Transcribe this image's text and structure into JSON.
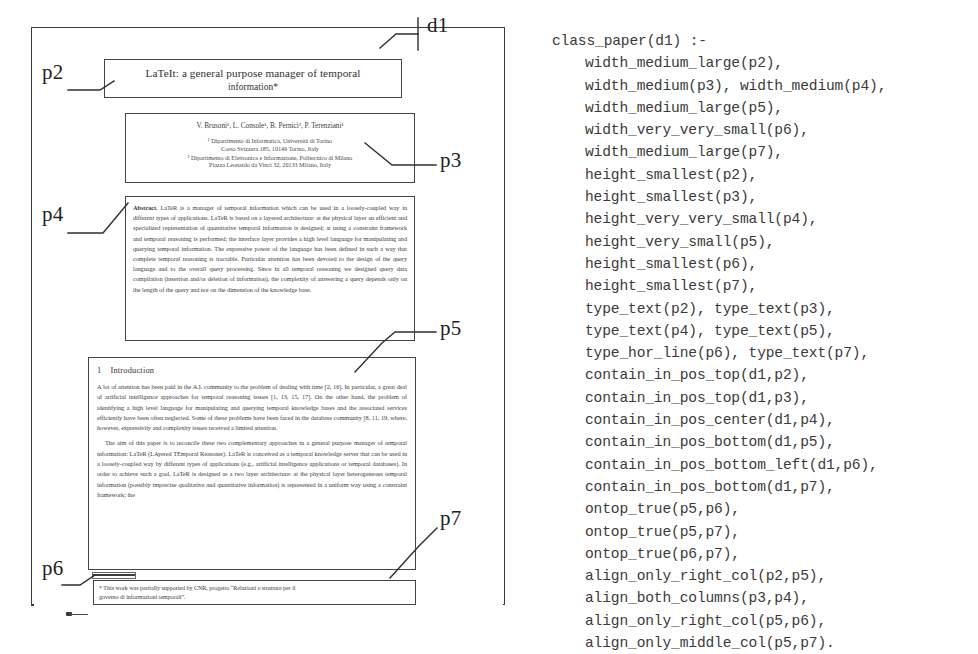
{
  "document_figure": {
    "frame_label": "d1",
    "part_labels": [
      "d1",
      "p2",
      "p3",
      "p4",
      "p5",
      "p6",
      "p7"
    ],
    "labels": {
      "d1": "d1",
      "p2": "p2",
      "p3": "p3",
      "p4": "p4",
      "p5": "p5",
      "p6": "p6",
      "p7": "p7"
    },
    "p2_title_block": {
      "line1": "LaTeIt: a general purpose manager of temporal",
      "line2": "information*"
    },
    "p3_author_block": {
      "authors": "V. Brusoni¹, L. Console¹, B. Pernici², P. Terenziani¹",
      "aff1_line1": "¹ Dipartimento di Informatica, Università di Torino",
      "aff1_line2": "Corso Svizzera 185, 10149 Torino, Italy",
      "aff2_line1": "² Dipartimento di Elettronica e Informazione, Politecnico di Milano",
      "aff2_line2": "Piazza Leonardo da Vinci 32, 20133 Milano, Italy"
    },
    "p4_abstract_block": {
      "heading": "Abstract.",
      "text": "LaTeR is a manager of temporal information which can be used in a loosely-coupled way in different types of applications. LaTeR is based on a layered architecture: at the physical layer an efficient and specialized representation of quantitative temporal information is designed; at using a constraint framework and temporal reasoning is performed; the interface layer provides a high level language for manipulating and querying temporal information. The expressive power of the language has been defined in such a way that complete temporal reasoning is tractable. Particular attention has been devoted to the design of the query language and to the overall query processing. Since in all temporal reasoning we designed query data compilation (insertion and/or deletion of information), the complexity of answering a query depends only on the length of the query and not on the dimension of the knowledge base."
    },
    "p5_body_block": {
      "section_number": "1",
      "section_title": "Introduction",
      "paragraph1": "A lot of attention has been paid in the A.I. community to the problem of dealing with time [2, 16]. In particular, a great deal of artificial intelligence approaches for temporal reasoning issues [1, 13, 15, 17]. On the other hand, the problem of identifying a high level language for manipulating and querying temporal knowledge bases and the associated services efficiently have been often neglected. Some of these problems have been faced in the database community [8, 11, 19, where, however, expressivity and complexity issues received a limited attention.",
      "paragraph2": "The aim of this paper is to reconcile these two complementary approaches in a general purpose manager of temporal information: LaTeR (LAyered TEmporal Reasoner). LaTeR is conceived as a temporal knowledge server that can be used in a loosely-coupled way by different types of applications (e.g., artificial intelligence applications or temporal databases). In order to achieve such a goal, LaTeR is designed as a two layer architecture: at the physical layer heterogeneous temporal information (possibly imprecise qualitative and quantitative information) is represented in a uniform way using a constraint framework; the"
    },
    "p6_rule_block": {
      "type": "horizontal line"
    },
    "p7_footnote_block": {
      "line1": "* This work was partially supported by CNR, progetto “Relazioni e strutture per il",
      "line2": "governo di informazioni temporali”."
    }
  },
  "code_listing": {
    "language": "prolog",
    "head": "class_paper(d1) :-",
    "lines": [
      "width_medium_large(p2),",
      "width_medium(p3), width_medium(p4),",
      "width_medium_large(p5),",
      "width_very_very_small(p6),",
      "width_medium_large(p7),",
      "height_smallest(p2),",
      "height_smallest(p3),",
      "height_very_very_small(p4),",
      "height_very_small(p5),",
      "height_smallest(p6),",
      "height_smallest(p7),",
      "type_text(p2), type_text(p3),",
      "type_text(p4), type_text(p5),",
      "type_hor_line(p6), type_text(p7),",
      "contain_in_pos_top(d1,p2),",
      "contain_in_pos_top(d1,p3),",
      "contain_in_pos_center(d1,p4),",
      "contain_in_pos_bottom(d1,p5),",
      "contain_in_pos_bottom_left(d1,p6),",
      "contain_in_pos_bottom(d1,p7),",
      "ontop_true(p5,p6),",
      "ontop_true(p5,p7),",
      "ontop_true(p6,p7),",
      "align_only_right_col(p2,p5),",
      "align_both_columns(p3,p4),",
      "align_only_right_col(p5,p6),",
      "align_only_middle_col(p5,p7)."
    ]
  },
  "colors": {
    "ink": "#3a3a3a",
    "border": "#444444",
    "background": "#ffffff"
  }
}
